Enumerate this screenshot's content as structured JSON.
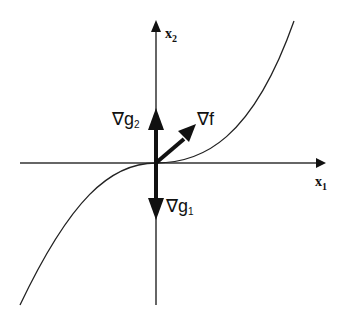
{
  "diagram": {
    "axes": {
      "x_label": "x",
      "x_sub": "1",
      "y_label": "x",
      "y_sub": "2"
    },
    "vectors": [
      {
        "name": "grad-f",
        "symbol": "∇f",
        "base": "∇",
        "main": "f",
        "sub": ""
      },
      {
        "name": "grad-g2",
        "symbol": "∇g2",
        "base": "∇",
        "main": "g",
        "sub": "2"
      },
      {
        "name": "grad-g1",
        "symbol": "∇g1",
        "base": "∇",
        "main": "g",
        "sub": "1"
      }
    ],
    "colors": {
      "line": "#111111",
      "background": "#ffffff"
    }
  }
}
